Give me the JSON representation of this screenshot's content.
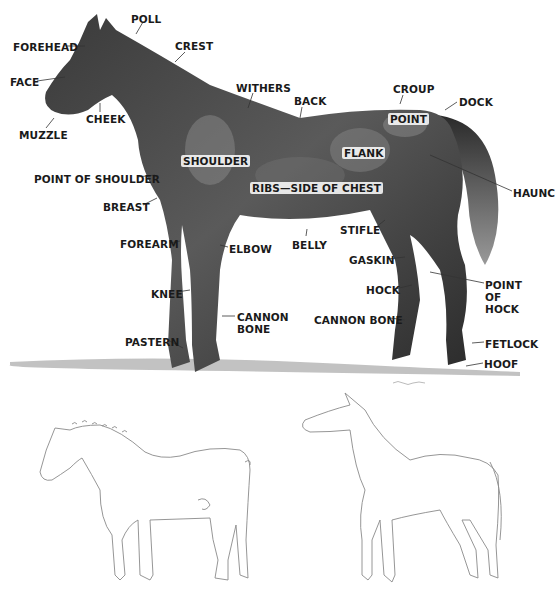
{
  "diagram": {
    "labels": [
      {
        "id": "poll",
        "text": "POLL",
        "x": 131,
        "y": 13
      },
      {
        "id": "forehead",
        "text": "FOREHEAD",
        "x": 13,
        "y": 41
      },
      {
        "id": "crest",
        "text": "CREST",
        "x": 175,
        "y": 40
      },
      {
        "id": "face",
        "text": "FACE",
        "x": 10,
        "y": 76
      },
      {
        "id": "withers",
        "text": "WITHERS",
        "x": 236,
        "y": 82
      },
      {
        "id": "croup",
        "text": "CROUP",
        "x": 393,
        "y": 83
      },
      {
        "id": "back",
        "text": "BACK",
        "x": 294,
        "y": 95
      },
      {
        "id": "dock",
        "text": "DOCK",
        "x": 459,
        "y": 96
      },
      {
        "id": "cheek",
        "text": "CHEEK",
        "x": 86,
        "y": 113
      },
      {
        "id": "point",
        "text": "POINT",
        "x": 388,
        "y": 113,
        "onbody": true
      },
      {
        "id": "muzzle",
        "text": "MUZZLE",
        "x": 19,
        "y": 129
      },
      {
        "id": "flank",
        "text": "FLANK",
        "x": 342,
        "y": 147,
        "onbody": true
      },
      {
        "id": "shoulder",
        "text": "SHOULDER",
        "x": 181,
        "y": 155,
        "onbody": true
      },
      {
        "id": "point-of-shoulder",
        "text": "POINT OF SHOULDER",
        "x": 34,
        "y": 173
      },
      {
        "id": "ribs-side-of-chest",
        "text": "RIBS—SIDE OF CHEST",
        "x": 250,
        "y": 182,
        "onbody": true
      },
      {
        "id": "haunch",
        "text": "HAUNC",
        "x": 513,
        "y": 187
      },
      {
        "id": "breast",
        "text": "BREAST",
        "x": 103,
        "y": 201
      },
      {
        "id": "stifle",
        "text": "STIFLE",
        "x": 340,
        "y": 224
      },
      {
        "id": "forearm",
        "text": "FOREARM",
        "x": 120,
        "y": 238
      },
      {
        "id": "elbow",
        "text": "ELBOW",
        "x": 229,
        "y": 243
      },
      {
        "id": "belly",
        "text": "BELLY",
        "x": 292,
        "y": 239
      },
      {
        "id": "gaskin",
        "text": "GASKIN",
        "x": 349,
        "y": 254
      },
      {
        "id": "point-of-hock",
        "text": "POINT\nOF\nHOCK",
        "x": 485,
        "y": 279
      },
      {
        "id": "knee",
        "text": "KNEE",
        "x": 151,
        "y": 288
      },
      {
        "id": "hock",
        "text": "HOCK",
        "x": 366,
        "y": 284
      },
      {
        "id": "cannon-bone-front",
        "text": "CANNON\nBONE",
        "x": 237,
        "y": 311
      },
      {
        "id": "cannon-bone-hind",
        "text": "CANNON BONE",
        "x": 314,
        "y": 314
      },
      {
        "id": "pastern",
        "text": "PASTERN",
        "x": 125,
        "y": 336
      },
      {
        "id": "fetlock",
        "text": "FETLOCK",
        "x": 485,
        "y": 338
      },
      {
        "id": "hoof",
        "text": "HOOF",
        "x": 484,
        "y": 358
      }
    ],
    "sketches": [
      {
        "id": "draft-horse-sketch",
        "description": "Pencil outline of a heavy draft horse with braided mane"
      },
      {
        "id": "light-horse-sketch",
        "description": "Pencil outline of a light riding horse with head raised"
      }
    ]
  }
}
